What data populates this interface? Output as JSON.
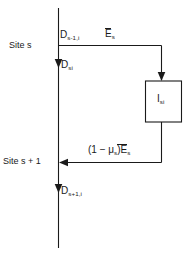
{
  "diagram": {
    "colors": {
      "background": "#ffffff",
      "stroke": "#1a1a1a",
      "text": "#1a1a1a"
    },
    "nodes": {
      "site_s": "Site s",
      "site_s_plus_1": "Site s + 1",
      "box_label_base": "I",
      "box_label_sub": "si"
    },
    "flows": {
      "inflow": {
        "base": "D",
        "sub": "s-1,i"
      },
      "top_branch": {
        "base": "E",
        "sub": "s",
        "overbar": true
      },
      "site_s_out": {
        "base": "D",
        "sub": "si"
      },
      "return_branch": {
        "prefix": "(1 − μ",
        "prefix_sub": "s",
        "mid": ")E",
        "suffix_sub": "s",
        "overbar": true
      },
      "outflow": {
        "base": "D",
        "sub": "s+1,i"
      }
    }
  }
}
